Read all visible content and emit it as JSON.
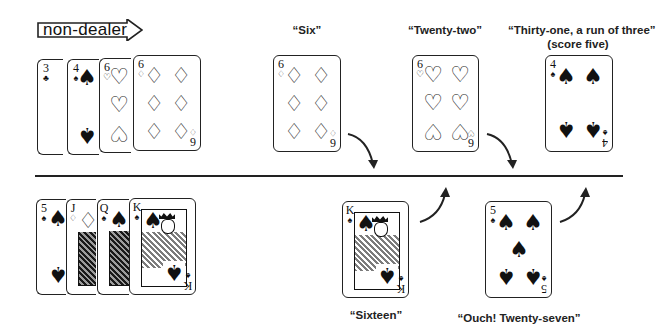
{
  "banner": {
    "label": "non-dealer",
    "icon": "right-arrow-icon"
  },
  "colors": {
    "ink": "#222222",
    "background": "#ffffff"
  },
  "top_row": {
    "role": "non-dealer",
    "hand": [
      {
        "rank": "3",
        "suit": "♣",
        "suit_name": "clubs"
      },
      {
        "rank": "4",
        "suit": "♠",
        "suit_name": "spades"
      },
      {
        "rank": "6",
        "suit": "♡",
        "suit_name": "hearts"
      },
      {
        "rank": "6",
        "suit": "♢",
        "suit_name": "diamonds"
      }
    ],
    "plays": [
      {
        "rank": "6",
        "suit": "♢",
        "suit_name": "diamonds",
        "caption": "“Six”",
        "caption_line2": ""
      },
      {
        "rank": "6",
        "suit": "♡",
        "suit_name": "hearts",
        "caption": "“Twenty-two”",
        "caption_line2": ""
      },
      {
        "rank": "4",
        "suit": "♠",
        "suit_name": "spades",
        "caption": "“Thirty-one, a run of three”",
        "caption_line2": "(score five)"
      }
    ]
  },
  "bottom_row": {
    "role": "dealer",
    "hand": [
      {
        "rank": "5",
        "suit": "♠",
        "suit_name": "spades"
      },
      {
        "rank": "J",
        "suit": "♢",
        "suit_name": "diamonds"
      },
      {
        "rank": "Q",
        "suit": "♠",
        "suit_name": "spades"
      },
      {
        "rank": "K",
        "suit": "♠",
        "suit_name": "spades"
      }
    ],
    "plays": [
      {
        "rank": "K",
        "suit": "♠",
        "suit_name": "spades",
        "caption": "“Sixteen”"
      },
      {
        "rank": "5",
        "suit": "♠",
        "suit_name": "spades",
        "caption": "“Ouch! Twenty-seven”"
      }
    ]
  }
}
